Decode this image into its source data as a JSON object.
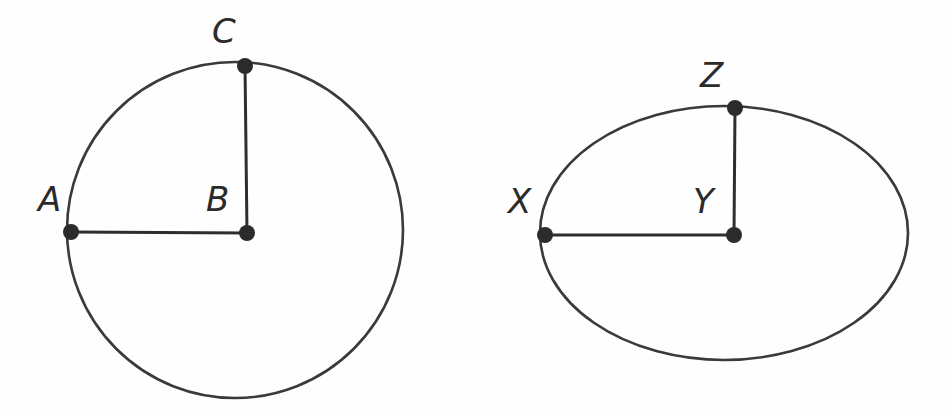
{
  "canvas": {
    "width": 951,
    "height": 416,
    "background_color": "#fefefe"
  },
  "style": {
    "outline_color": "#3a3a3a",
    "segment_color": "#2e2e2e",
    "dot_color": "#2b2b2b",
    "label_color": "#2b2b2b",
    "outline_width": 2.6,
    "segment_width": 3.0,
    "dot_radius": 8
  },
  "figures": [
    {
      "id": "circle-figure",
      "kind": "circle",
      "geometry": {
        "cx": 235,
        "cy": 230,
        "r": 168
      },
      "points": [
        {
          "id": "point-a",
          "label": "A",
          "role": "point-on-circle",
          "x": 71,
          "y": 232,
          "label_x": 38,
          "label_y": 182
        },
        {
          "id": "point-b",
          "label": "B",
          "role": "center",
          "x": 247,
          "y": 233,
          "label_x": 206,
          "label_y": 182
        },
        {
          "id": "point-c",
          "label": "C",
          "role": "point-on-circle",
          "x": 245,
          "y": 66,
          "label_x": 212,
          "label_y": 14
        }
      ],
      "segments": [
        {
          "id": "segment-ab",
          "from": "point-a",
          "to": "point-b",
          "x1": 71,
          "y1": 232,
          "x2": 247,
          "y2": 233
        },
        {
          "id": "segment-cb",
          "from": "point-c",
          "to": "point-b",
          "x1": 245,
          "y1": 66,
          "x2": 247,
          "y2": 233
        }
      ]
    },
    {
      "id": "ellipse-figure",
      "kind": "ellipse",
      "geometry": {
        "cx": 724,
        "cy": 233,
        "rx": 184,
        "ry": 127
      },
      "points": [
        {
          "id": "point-x",
          "label": "X",
          "role": "point-on-ellipse",
          "x": 545,
          "y": 235,
          "label_x": 508,
          "label_y": 184
        },
        {
          "id": "point-y",
          "label": "Y",
          "role": "center",
          "x": 734,
          "y": 235,
          "label_x": 693,
          "label_y": 184
        },
        {
          "id": "point-z",
          "label": "Z",
          "role": "point-on-ellipse",
          "x": 735,
          "y": 108,
          "label_x": 700,
          "label_y": 58
        }
      ],
      "segments": [
        {
          "id": "segment-xy",
          "from": "point-x",
          "to": "point-y",
          "x1": 545,
          "y1": 235,
          "x2": 734,
          "y2": 235
        },
        {
          "id": "segment-zy",
          "from": "point-z",
          "to": "point-y",
          "x1": 735,
          "y1": 108,
          "x2": 734,
          "y2": 235
        }
      ]
    }
  ]
}
